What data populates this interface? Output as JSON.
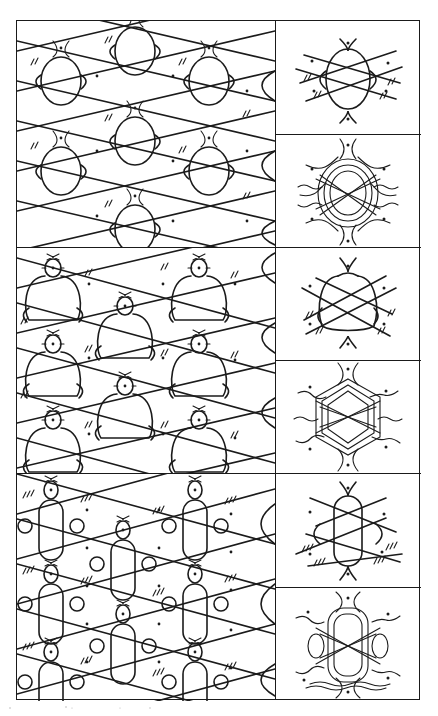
{
  "figure": {
    "kind": "bobbin lace ground diagrams",
    "layout": "3 rows; each row = one large repeating-pattern panel (left) + two detail panels (right: schematic unit, worked-thread unit)",
    "colors": {
      "ink": "#1b1b1b",
      "paper": "#ffffff",
      "frame": "#1a1a1a"
    },
    "rows": [
      {
        "id": "row-1",
        "pattern_panel": {
          "name": "ground-pattern-1",
          "description": "repeating mesh of rounded cells joined by twisted pairs, dots marking pin holes, cross-hatch ticks marking twists"
        },
        "detail_top": {
          "name": "ground-1-schematic",
          "description": "single oval cell with crossing pair lines, pin dots and twist ticks"
        },
        "detail_bottom": {
          "name": "ground-1-worked",
          "description": "same cell drawn as worked, braided threads"
        }
      },
      {
        "id": "row-2",
        "pattern_panel": {
          "name": "ground-pattern-2",
          "description": "repeating mesh of bell-shaped cells, diagonal crossing pairs, pin dots and twist ticks"
        },
        "detail_top": {
          "name": "ground-2-schematic",
          "description": "single bell-shaped cell with crossing pair lines"
        },
        "detail_bottom": {
          "name": "ground-2-worked",
          "description": "same cell drawn as worked, braided threads (hexagonal)"
        }
      },
      {
        "id": "row-3",
        "pattern_panel": {
          "name": "ground-pattern-3",
          "description": "repeating mesh of elongated capsule cells with side loops, diagonal pairs with triple twist ticks"
        },
        "detail_top": {
          "name": "ground-3-schematic",
          "description": "single elongated capsule cell with side loops and crossing pairs"
        },
        "detail_bottom": {
          "name": "ground-3-worked",
          "description": "same cell drawn as worked, braided threads"
        }
      }
    ]
  }
}
